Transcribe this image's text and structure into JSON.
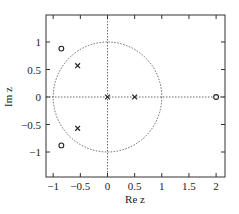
{
  "chart_data": {
    "type": "scatter",
    "title": "",
    "xlabel": "Re z",
    "ylabel": "Im z",
    "xlim": [
      -1.1,
      2.2
    ],
    "ylim": [
      -1.45,
      1.45
    ],
    "xticks": [
      -1,
      -0.5,
      0,
      0.5,
      1,
      1.5,
      2
    ],
    "xtick_labels": [
      "−1",
      "−0.5",
      "0",
      "0.5",
      "1",
      "1.5",
      "2"
    ],
    "yticks": [
      1,
      0.5,
      0,
      -0.5,
      -1
    ],
    "ytick_labels": [
      "1",
      "0.5",
      "0",
      "−0.5",
      "−1"
    ],
    "grid": false,
    "unit_circle": {
      "center": [
        0,
        0
      ],
      "radius": 1,
      "style": "dotted"
    },
    "reference_axes": {
      "horizontal": 0,
      "vertical": 0,
      "style": "dotted"
    },
    "series": [
      {
        "name": "zeros",
        "marker": "o",
        "points": [
          [
            2,
            0
          ],
          [
            -0.85,
            0.88
          ],
          [
            -0.85,
            -0.88
          ]
        ]
      },
      {
        "name": "poles",
        "marker": "x",
        "points": [
          [
            0,
            0
          ],
          [
            0.5,
            0
          ],
          [
            -0.55,
            0.57
          ],
          [
            -0.55,
            -0.57
          ]
        ]
      }
    ]
  }
}
